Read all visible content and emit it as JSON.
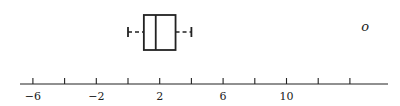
{
  "chart_data": {
    "type": "boxplot",
    "title": "",
    "xlabel": "",
    "ylabel": "",
    "orientation": "horizontal",
    "xlim": [
      -7,
      17
    ],
    "ticks": [
      -6,
      -4,
      -2,
      0,
      2,
      4,
      6,
      8,
      10,
      12,
      14
    ],
    "tick_labels": [
      {
        "value": -6,
        "label": "−6"
      },
      {
        "value": -2,
        "label": "−2"
      },
      {
        "value": 2,
        "label": "2"
      },
      {
        "value": 6,
        "label": "6"
      },
      {
        "value": 10,
        "label": "10"
      }
    ],
    "box": {
      "whisker_low": 0,
      "q1": 1,
      "median": 1.75,
      "q3": 3,
      "whisker_high": 4
    },
    "outliers": [
      {
        "value": 15,
        "marker": "o"
      }
    ],
    "grid": false,
    "legend": null
  },
  "colors": {
    "stroke": "#222222",
    "background": "#ffffff"
  }
}
